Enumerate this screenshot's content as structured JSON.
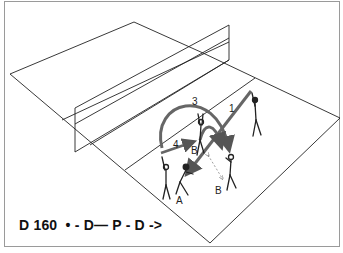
{
  "figure": {
    "caption": "D 160  • - D— P - D ->",
    "arrow_labels": [
      "1",
      "3",
      "4"
    ],
    "player_labels": [
      "A",
      "B",
      "B"
    ],
    "colors": {
      "line": "#222222",
      "arrow": "#555555",
      "frame": "#9a9a9a",
      "background": "#ffffff"
    }
  }
}
